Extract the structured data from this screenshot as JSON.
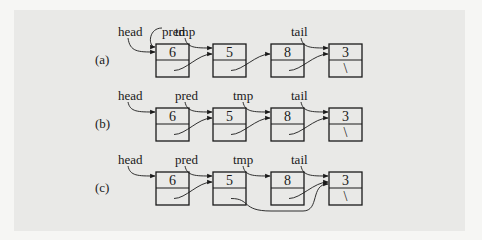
{
  "diagram": {
    "colors": {
      "background": "#f6f6f4",
      "panel": "#e9e9e7",
      "ink": "#1a1a1a"
    },
    "node_geometry": {
      "width": 33,
      "data_height": 16,
      "link_height": 17,
      "xs": [
        156,
        213,
        271,
        329
      ]
    },
    "rows": [
      {
        "label": "(a)",
        "top": 44,
        "nodes": [
          {
            "value": "6",
            "null_link": false
          },
          {
            "value": "5",
            "null_link": false
          },
          {
            "value": "8",
            "null_link": false
          },
          {
            "value": "3",
            "null_link": true,
            "null_symbol": "\\"
          }
        ],
        "pointers": [
          {
            "name": "head",
            "target": 0
          },
          {
            "name": "pred",
            "target": 0
          },
          {
            "name": "tmp",
            "target": 1
          },
          {
            "name": "tail",
            "target": 3
          }
        ],
        "links": [
          [
            0,
            1
          ],
          [
            1,
            2
          ],
          [
            2,
            3
          ]
        ]
      },
      {
        "label": "(b)",
        "top": 108,
        "nodes": [
          {
            "value": "6",
            "null_link": false
          },
          {
            "value": "5",
            "null_link": false
          },
          {
            "value": "8",
            "null_link": false
          },
          {
            "value": "3",
            "null_link": true,
            "null_symbol": "\\"
          }
        ],
        "pointers": [
          {
            "name": "head",
            "target": 0
          },
          {
            "name": "pred",
            "target": 1
          },
          {
            "name": "tmp",
            "target": 2
          },
          {
            "name": "tail",
            "target": 3
          }
        ],
        "links": [
          [
            0,
            1
          ],
          [
            1,
            2
          ],
          [
            2,
            3
          ]
        ]
      },
      {
        "label": "(c)",
        "top": 172,
        "nodes": [
          {
            "value": "6",
            "null_link": false
          },
          {
            "value": "5",
            "null_link": false
          },
          {
            "value": "8",
            "null_link": false
          },
          {
            "value": "3",
            "null_link": true,
            "null_symbol": "\\"
          }
        ],
        "pointers": [
          {
            "name": "head",
            "target": 0
          },
          {
            "name": "pred",
            "target": 1
          },
          {
            "name": "tmp",
            "target": 2
          },
          {
            "name": "tail",
            "target": 3
          }
        ],
        "links": [
          [
            0,
            1
          ],
          [
            1,
            3
          ],
          [
            2,
            3
          ]
        ]
      }
    ]
  }
}
